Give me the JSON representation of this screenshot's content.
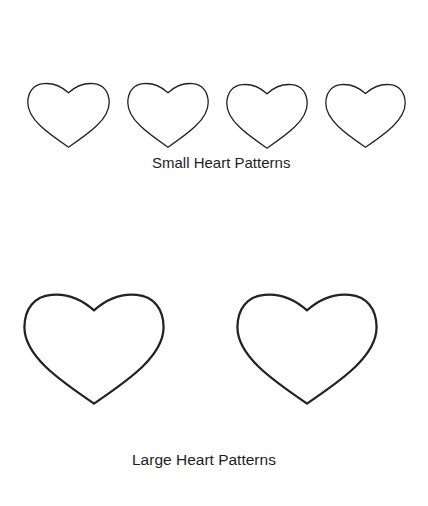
{
  "page": {
    "background": "#ffffff",
    "stroke_color": "#222222"
  },
  "small_hearts": {
    "caption": "Small Heart Patterns",
    "count": 4,
    "items": [
      {
        "label": "small-heart-1",
        "left": 27,
        "top": 82,
        "width": 83,
        "height": 66
      },
      {
        "label": "small-heart-2",
        "left": 127,
        "top": 82,
        "width": 82,
        "height": 66
      },
      {
        "label": "small-heart-3",
        "left": 226,
        "top": 83,
        "width": 82,
        "height": 66
      },
      {
        "label": "small-heart-4",
        "left": 325,
        "top": 83,
        "width": 81,
        "height": 65
      }
    ]
  },
  "large_hearts": {
    "caption": "Large Heart Patterns",
    "count": 2,
    "items": [
      {
        "label": "large-heart-1",
        "left": 23,
        "top": 292,
        "width": 142,
        "height": 113
      },
      {
        "label": "large-heart-2",
        "left": 236,
        "top": 292,
        "width": 142,
        "height": 113
      }
    ]
  }
}
